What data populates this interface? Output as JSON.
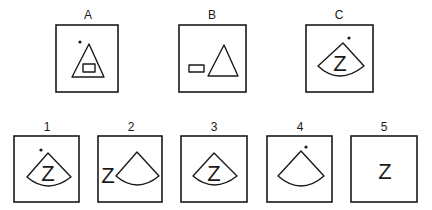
{
  "figure": {
    "stimuli": [
      {
        "label": "A",
        "contents": [
          "dot",
          "triangle",
          "rectangle-inside-triangle"
        ]
      },
      {
        "label": "B",
        "contents": [
          "rectangle",
          "triangle"
        ]
      },
      {
        "label": "C",
        "contents": [
          "dot",
          "fan-sector",
          "letter-Z-inside-sector"
        ],
        "letter": "Z"
      }
    ],
    "options": [
      {
        "label": "1",
        "contents": [
          "dot",
          "fan-sector",
          "letter-Z-inside-sector"
        ],
        "letter": "Z"
      },
      {
        "label": "2",
        "contents": [
          "letter-Z-left",
          "fan-sector"
        ],
        "letter": "Z"
      },
      {
        "label": "3",
        "contents": [
          "fan-sector",
          "letter-Z-inside-sector"
        ],
        "letter": "Z"
      },
      {
        "label": "4",
        "contents": [
          "dot",
          "fan-sector"
        ]
      },
      {
        "label": "5",
        "contents": [
          "letter-Z"
        ],
        "letter": "Z"
      }
    ]
  },
  "colors": {
    "ink": "#1a1a1a",
    "background": "#ffffff"
  }
}
